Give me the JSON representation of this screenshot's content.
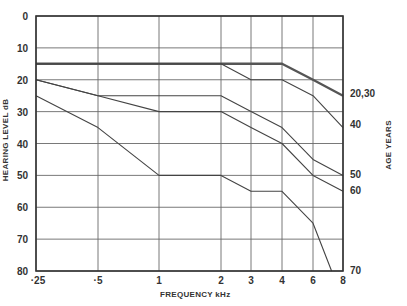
{
  "chart_data": {
    "type": "line",
    "title": "",
    "xlabel": "FREQUENCY kHz",
    "ylabel": "HEARING LEVEL dB",
    "legend_title": "AGE YEARS",
    "x": [
      "·25",
      "·5",
      "1",
      "2",
      "3",
      "4",
      "6",
      "8"
    ],
    "x_khz": [
      0.25,
      0.5,
      1,
      2,
      3,
      4,
      6,
      8
    ],
    "ylim": [
      0,
      80
    ],
    "y_inverted": true,
    "y_ticks": [
      0,
      10,
      20,
      30,
      40,
      50,
      60,
      70,
      80
    ],
    "grid": true,
    "legend_position": "right (labels at line ends)",
    "series": [
      {
        "name": "20,30",
        "values": [
          15,
          15,
          15,
          15,
          15,
          15,
          20,
          25
        ]
      },
      {
        "name": "40",
        "values": [
          15,
          15,
          15,
          15,
          20,
          20,
          25,
          35
        ]
      },
      {
        "name": "50",
        "values": [
          20,
          25,
          25,
          25,
          30,
          35,
          45,
          50
        ]
      },
      {
        "name": "60",
        "values": [
          20,
          25,
          30,
          30,
          35,
          40,
          50,
          55
        ]
      },
      {
        "name": "70",
        "values": [
          25,
          35,
          50,
          50,
          55,
          55,
          65,
          80
        ],
        "note": "reaches 80 dB at about 7.3 kHz"
      }
    ]
  },
  "layout": {
    "plot": {
      "left": 36,
      "right": 343,
      "top": 16,
      "bottom": 271
    },
    "x_px": [
      36,
      98,
      159,
      221,
      251,
      282,
      313,
      343
    ]
  }
}
